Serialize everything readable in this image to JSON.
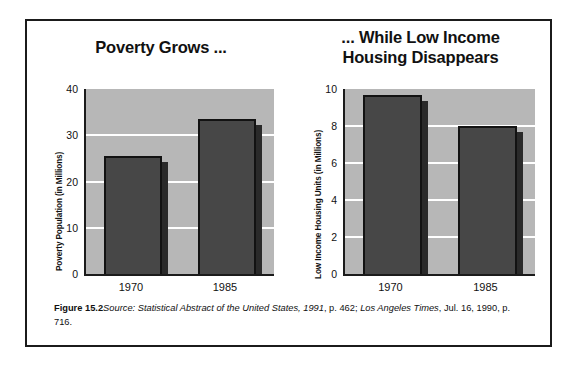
{
  "figure": {
    "caption_label": "Figure 15.2",
    "caption_source_prefix": "Source: ",
    "caption_italic_1": "Statistical Abstract of the United States, 1991",
    "caption_plain_1": ", p. 462; ",
    "caption_italic_2": "Los Angeles Times",
    "caption_plain_2": ", Jul. 16, 1990, p. 716."
  },
  "chart_data": [
    {
      "id": "poverty",
      "type": "bar",
      "title": "Poverty Grows ...",
      "xlabel": "",
      "ylabel": "Poverty Population (in Millions)",
      "categories": [
        "1970",
        "1985"
      ],
      "values": [
        25.5,
        33.5
      ],
      "ylim": [
        0,
        40
      ],
      "yticks": [
        0,
        10,
        20,
        30,
        40
      ],
      "ytick_labels": [
        "0",
        "10",
        "20",
        "30",
        "40"
      ],
      "grid": true,
      "legend": "none",
      "colors": {
        "bar": "#474747",
        "bar_outline": "#121212",
        "bar_shadow": "#2a2a2a",
        "plot_background": "#b7b7b7",
        "gridline": "#ffffff",
        "axis": "#1b1b1b"
      }
    },
    {
      "id": "housing",
      "type": "bar",
      "title": "... While Low Income Housing Disappears",
      "title_line_1": "... While Low Income",
      "title_line_2": "Housing Disappears",
      "xlabel": "",
      "ylabel": "Low Income Housing Units (in Millions)",
      "categories": [
        "1970",
        "1985"
      ],
      "values": [
        9.7,
        8.0
      ],
      "ylim": [
        0,
        10
      ],
      "yticks": [
        0,
        2,
        4,
        6,
        8,
        10
      ],
      "ytick_labels": [
        "0",
        "2",
        "4",
        "6",
        "8",
        "10"
      ],
      "grid": true,
      "legend": "none",
      "colors": {
        "bar": "#474747",
        "bar_outline": "#121212",
        "bar_shadow": "#2a2a2a",
        "plot_background": "#b7b7b7",
        "gridline": "#ffffff",
        "axis": "#1b1b1b"
      }
    }
  ]
}
